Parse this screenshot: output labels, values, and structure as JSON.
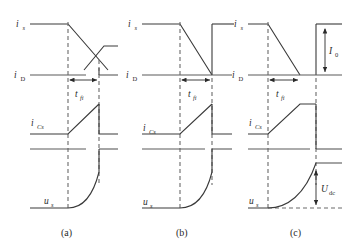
{
  "figure": {
    "type": "waveform-diagram",
    "panels": [
      {
        "id": "a",
        "caption": "(a)",
        "traces": [
          {
            "name": "source-current",
            "label": "i",
            "subscript": "s",
            "shape": "high-level then linear fall crossing a rising ramp"
          },
          {
            "name": "device-current",
            "label": "i",
            "subscript": "D",
            "shape": "baseline with step"
          },
          {
            "name": "snubber-capacitor-current",
            "label": "i",
            "subscript": "Cs",
            "shape": "zero then linear rise then drop to zero"
          },
          {
            "name": "device-voltage",
            "label": "u",
            "subscript": "s",
            "shape": "zero then exponential rise to plateau"
          }
        ],
        "interval": {
          "label": "t",
          "subscript": "fi"
        }
      },
      {
        "id": "b",
        "caption": "(b)",
        "traces": [
          {
            "name": "source-current",
            "label": "i",
            "subscript": "s",
            "shape": "high level then linear fall to baseline at end of interval"
          },
          {
            "name": "device-current",
            "label": "i",
            "subscript": "D",
            "shape": "baseline with step"
          },
          {
            "name": "snubber-capacitor-current",
            "label": "i",
            "subscript": "Cs",
            "shape": "zero then linear rise then drop to zero"
          },
          {
            "name": "device-voltage",
            "label": "u",
            "subscript": "s",
            "shape": "zero then exponential rise to plateau"
          }
        ],
        "interval": {
          "label": "t",
          "subscript": "fi"
        }
      },
      {
        "id": "c",
        "caption": "(c)",
        "traces": [
          {
            "name": "source-current",
            "label": "i",
            "subscript": "s",
            "shape": "high level then steep linear fall to baseline before interval end"
          },
          {
            "name": "device-current",
            "label": "i",
            "subscript": "D",
            "shape": "baseline with step"
          },
          {
            "name": "snubber-capacitor-current",
            "label": "i",
            "subscript": "Cs",
            "shape": "zero then linear rise to plateau then drop to zero"
          },
          {
            "name": "device-voltage",
            "label": "u",
            "subscript": "s",
            "shape": "zero then exponential rise to plateau"
          }
        ],
        "interval": {
          "label": "t",
          "subscript": "fi"
        },
        "measures": [
          {
            "name": "load-current",
            "label": "I",
            "subscript": "0",
            "orientation": "vertical-double-arrow"
          },
          {
            "name": "dc-link-voltage",
            "label": "U",
            "subscript": "dc",
            "orientation": "vertical-double-arrow"
          }
        ]
      }
    ],
    "colors": {
      "wave": "#3a3a3a",
      "axis": "#5a5a5a",
      "dashed": "#6a6a6a",
      "text": "#2a2a2a",
      "background": "#ffffff"
    }
  }
}
